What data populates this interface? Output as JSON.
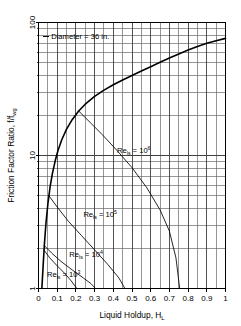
{
  "chart_data": {
    "type": "line",
    "title": "",
    "annotation": "Diameter = 36 in.",
    "xlabel": "Liquid Holdup, H",
    "xlabel_sub": "L",
    "ylabel": "Friction Factor Ratio, f/f",
    "ylabel_sub": "wg",
    "xlim": [
      0,
      1
    ],
    "ylim": [
      1,
      100
    ],
    "yscale": "log",
    "xscale": "linear",
    "grid": true,
    "legend": "inline-annotations",
    "xticks": [
      "0",
      "0.1",
      "0.2",
      "0.3",
      "0.4",
      "0.5",
      "0.6",
      "0.7",
      "0.8",
      "0.9",
      "1"
    ],
    "xtick_values": [
      0,
      0.1,
      0.2,
      0.3,
      0.4,
      0.5,
      0.6,
      0.7,
      0.8,
      0.9,
      1
    ],
    "yticks": [
      "1",
      "10",
      "100"
    ],
    "ytick_values": [
      1,
      10,
      100
    ],
    "y_minor_values": [
      2,
      3,
      4,
      5,
      6,
      7,
      8,
      9,
      20,
      30,
      40,
      50,
      60,
      70,
      80,
      90
    ],
    "x_minor_values": [
      0.05,
      0.15,
      0.25,
      0.35,
      0.45,
      0.55,
      0.65,
      0.75,
      0.85,
      0.95
    ],
    "series": [
      {
        "name": "envelope",
        "label": "",
        "points": [
          [
            0.018,
            1.0
          ],
          [
            0.025,
            1.5
          ],
          [
            0.032,
            2.2
          ],
          [
            0.04,
            3.1
          ],
          [
            0.05,
            4.3
          ],
          [
            0.062,
            5.8
          ],
          [
            0.075,
            7.4
          ],
          [
            0.09,
            9.2
          ],
          [
            0.105,
            11.0
          ],
          [
            0.125,
            13.2
          ],
          [
            0.15,
            15.8
          ],
          [
            0.18,
            18.6
          ],
          [
            0.215,
            21.6
          ],
          [
            0.25,
            24.3
          ],
          [
            0.3,
            27.8
          ],
          [
            0.35,
            31.0
          ],
          [
            0.4,
            34.0
          ],
          [
            0.45,
            37.0
          ],
          [
            0.5,
            40.0
          ],
          [
            0.55,
            43.2
          ],
          [
            0.6,
            46.5
          ],
          [
            0.65,
            50.2
          ],
          [
            0.7,
            54.0
          ],
          [
            0.75,
            58.0
          ],
          [
            0.8,
            62.0
          ],
          [
            0.85,
            66.0
          ],
          [
            0.9,
            69.8
          ],
          [
            0.95,
            73.0
          ],
          [
            1.0,
            76.0
          ]
        ]
      },
      {
        "name": "Re_ls = 10^6",
        "label": "Re",
        "label_sub": "ls",
        "label_eq": " = 10",
        "label_exp": "6",
        "branch_point": [
          0.215,
          21.6
        ],
        "points": [
          [
            0.215,
            21.6
          ],
          [
            0.28,
            17.5
          ],
          [
            0.34,
            14.4
          ],
          [
            0.42,
            10.9
          ],
          [
            0.5,
            8.1
          ],
          [
            0.58,
            5.7
          ],
          [
            0.65,
            3.9
          ],
          [
            0.7,
            2.7
          ],
          [
            0.735,
            1.7
          ],
          [
            0.755,
            1.0
          ]
        ]
      },
      {
        "name": "Re_ls = 10^5",
        "label": "Re",
        "label_sub": "ls",
        "label_eq": " = 10",
        "label_exp": "5",
        "branch_point": [
          0.055,
          5.0
        ],
        "points": [
          [
            0.055,
            5.0
          ],
          [
            0.1,
            4.1
          ],
          [
            0.16,
            3.2
          ],
          [
            0.23,
            2.5
          ],
          [
            0.3,
            1.95
          ],
          [
            0.37,
            1.52
          ],
          [
            0.43,
            1.2
          ],
          [
            0.462,
            1.0
          ]
        ]
      },
      {
        "name": "Re_ls = 10^4",
        "label": "Re",
        "label_sub": "ls",
        "label_eq": " = 10",
        "label_exp": "4",
        "branch_point": [
          0.031,
          2.1
        ],
        "points": [
          [
            0.031,
            2.1
          ],
          [
            0.07,
            1.85
          ],
          [
            0.12,
            1.6
          ],
          [
            0.18,
            1.38
          ],
          [
            0.24,
            1.2
          ],
          [
            0.28,
            1.09
          ],
          [
            0.305,
            1.0
          ]
        ]
      },
      {
        "name": "Re_ls = 10^3",
        "label": "Re",
        "label_sub": "ls",
        "label_eq": " = 10",
        "label_exp": "3",
        "branch_point": [
          0.029,
          1.95
        ],
        "points": [
          [
            0.029,
            1.95
          ],
          [
            0.06,
            1.7
          ],
          [
            0.1,
            1.48
          ],
          [
            0.14,
            1.3
          ],
          [
            0.175,
            1.14
          ],
          [
            0.205,
            1.0
          ]
        ]
      }
    ],
    "annotations": [
      {
        "text": "Diameter = 36 in.",
        "x": 0.1,
        "y": 78,
        "name": "diameter-note"
      },
      {
        "text": "Re_ls = 10^6",
        "x": 0.42,
        "y": 10.4,
        "name": "re-6-label"
      },
      {
        "text": "Re_ls = 10^5",
        "x": 0.24,
        "y": 3.45,
        "name": "re-5-label"
      },
      {
        "text": "Re_ls = 10^4",
        "x": 0.165,
        "y": 1.72,
        "name": "re-4-label"
      },
      {
        "text": "Re_ls = 10^3",
        "x": 0.045,
        "y": 1.22,
        "name": "re-3-label"
      }
    ],
    "colors": {
      "axis": "#000000",
      "grid_major": "#404040",
      "grid_minor": "#6a6a6a",
      "curve": "#000000",
      "background": "#ffffff"
    }
  }
}
